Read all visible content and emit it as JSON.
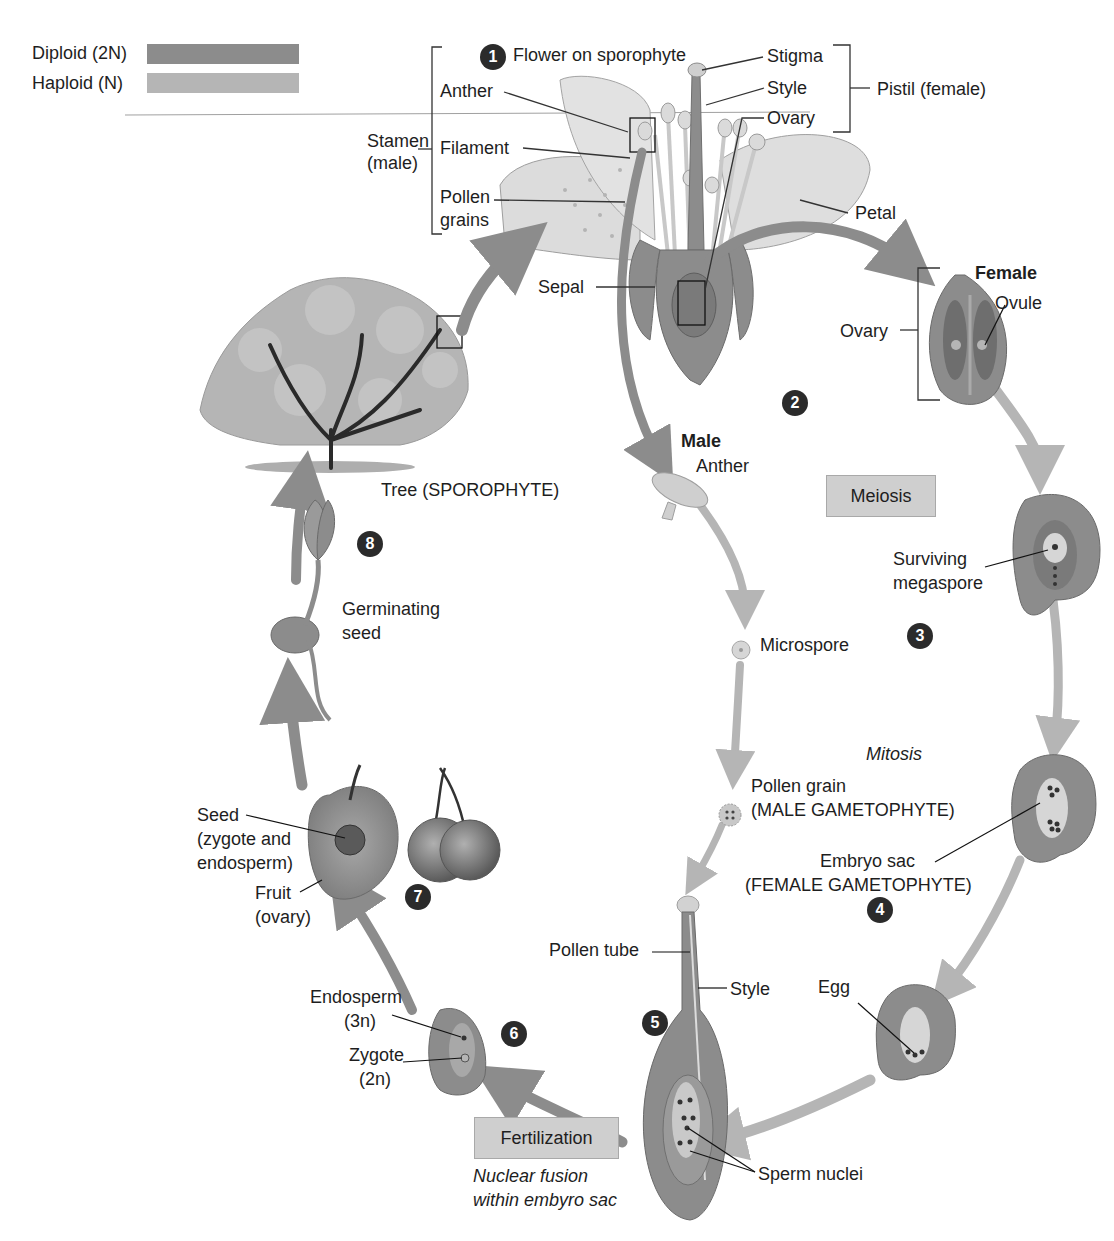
{
  "legend": {
    "items": [
      {
        "label": "Diploid (2N)",
        "color": "#8c8c8c"
      },
      {
        "label": "Haploid (N)",
        "color": "#b5b5b5"
      }
    ]
  },
  "colors": {
    "diploid": "#8c8c8c",
    "haploid": "#b5b5b5",
    "step_badge": "#2b2b2b",
    "process_box": "#cfcfcf",
    "background": "#ffffff"
  },
  "steps": [
    {
      "number": "1",
      "label": "Flower on sporophyte"
    },
    {
      "number": "2",
      "label": ""
    },
    {
      "number": "3",
      "label": ""
    },
    {
      "number": "4",
      "label": ""
    },
    {
      "number": "5",
      "label": ""
    },
    {
      "number": "6",
      "label": ""
    },
    {
      "number": "7",
      "label": ""
    },
    {
      "number": "8",
      "label": ""
    }
  ],
  "flower": {
    "stamen_group": {
      "line1": "Stamen",
      "line2": "(male)"
    },
    "anther": "Anther",
    "filament": "Filament",
    "pollen_grains": {
      "line1": "Pollen",
      "line2": "grains"
    },
    "stigma": "Stigma",
    "style": "Style",
    "ovary": "Ovary",
    "pistil_group": "Pistil (female)",
    "petal": "Petal",
    "sepal": "Sepal"
  },
  "female_path": {
    "heading": "Female",
    "ovule": "Ovule",
    "ovary": "Ovary",
    "surviving_megaspore": {
      "line1": "Surviving",
      "line2": "megaspore"
    },
    "embryo_sac": {
      "line1": "Embryo sac",
      "line2": "(FEMALE GAMETOPHYTE)"
    },
    "egg": "Egg"
  },
  "male_path": {
    "heading": "Male",
    "anther": "Anther",
    "microspore": "Microspore",
    "pollen_grain": {
      "line1": "Pollen grain",
      "line2": "(MALE GAMETOPHYTE)"
    }
  },
  "processes": {
    "meiosis": "Meiosis",
    "mitosis": "Mitosis",
    "fertilization": "Fertilization",
    "fertilization_note": {
      "line1": "Nuclear fusion",
      "line2": "within embyro sac"
    }
  },
  "fertilization_stage": {
    "pollen_tube": "Pollen tube",
    "style": "Style",
    "sperm_nuclei": "Sperm nuclei"
  },
  "seed_stage": {
    "endosperm": {
      "line1": "Endosperm",
      "line2": "(3n)"
    },
    "zygote": {
      "line1": "Zygote",
      "line2": "(2n)"
    }
  },
  "fruit_stage": {
    "seed": {
      "line1": "Seed",
      "line2": "(zygote and",
      "line3": "endosperm)"
    },
    "fruit": {
      "line1": "Fruit",
      "line2": "(ovary)"
    }
  },
  "germination": {
    "germinating_seed": {
      "line1": "Germinating",
      "line2": "seed"
    }
  },
  "tree": {
    "label": "Tree (SPOROPHYTE)"
  }
}
